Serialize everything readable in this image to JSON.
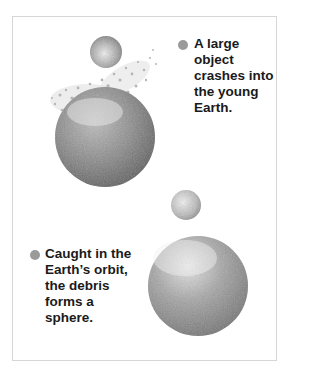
{
  "diagram": {
    "steps": [
      {
        "label": "A large object crashes into the young Earth.",
        "lines": [
          "A large",
          "object",
          "crashes into",
          "the young",
          "Earth."
        ]
      },
      {
        "label": "Caught in the Earth's orbit, the debris forms a sphere.",
        "lines": [
          "Caught in the",
          "Earth’s orbit,",
          "the debris",
          "forms a",
          "sphere."
        ]
      }
    ],
    "colors": {
      "bullet": "#9a9a9a",
      "frame": "#d6d6d6",
      "text": "#1a1a1a"
    }
  }
}
